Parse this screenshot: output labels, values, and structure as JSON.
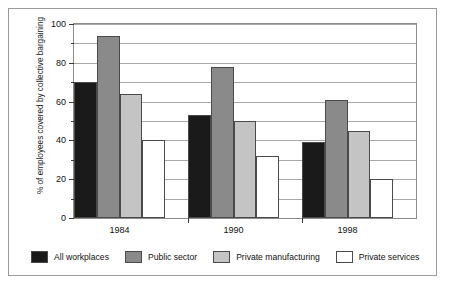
{
  "chart_data": {
    "type": "bar",
    "title": "",
    "xlabel": "",
    "ylabel": "% of employees covered by collective bargaining",
    "categories": [
      "1984",
      "1990",
      "1998"
    ],
    "series": [
      {
        "name": "All workplaces",
        "color": "#1a1a1a",
        "values": [
          70,
          53,
          39
        ]
      },
      {
        "name": "Public sector",
        "color": "#8a8a8a",
        "values": [
          94,
          78,
          61
        ]
      },
      {
        "name": "Private manufacturing",
        "color": "#c4c4c4",
        "values": [
          64,
          50,
          45
        ]
      },
      {
        "name": "Private services",
        "color": "#ffffff",
        "values": [
          40,
          32,
          20
        ]
      }
    ],
    "ylim": [
      0,
      100
    ],
    "y_ticks": [
      0,
      20,
      40,
      60,
      80,
      100
    ],
    "y_tick_labels": [
      "0",
      "20",
      "40",
      "60",
      "80",
      "100"
    ],
    "y_minor_ticks": [
      10,
      30,
      50,
      70,
      90
    ],
    "gridlines": [
      10,
      20,
      30,
      40,
      50,
      60,
      70,
      80,
      90,
      100
    ],
    "grid": true,
    "legend_position": "bottom"
  }
}
